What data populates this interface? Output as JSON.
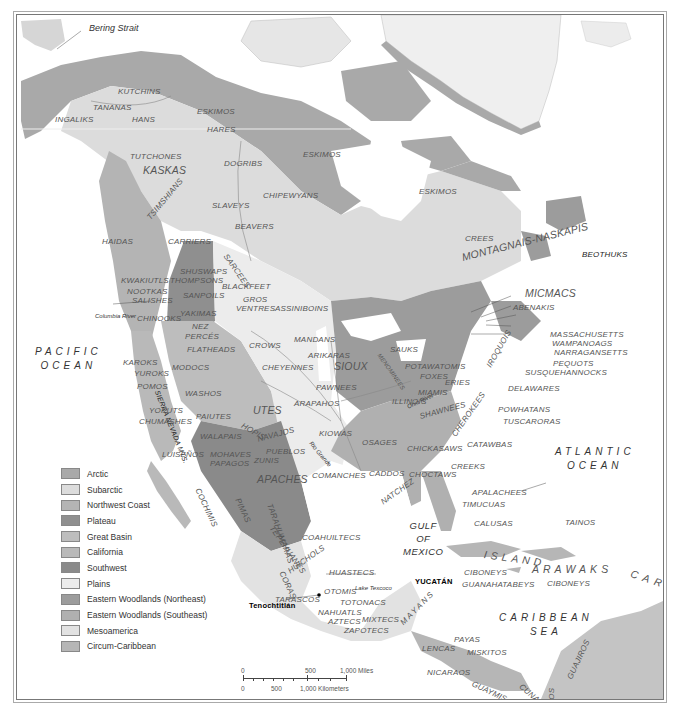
{
  "map": {
    "title_features": {
      "bering_strait": "Bering Strait",
      "columbia_river": "Columbia River",
      "sierra_nevada": "SIERRA NEVADA MTS.",
      "ohio_river": "Ohio River",
      "mississippi": "Mississippi",
      "lake_michigan": "Lake Michigan",
      "rio_grande": "Rio Grande",
      "missouri": "Missouri",
      "lake_texcoco": "Lake Texcoco",
      "tenochtitlan": "Tenochtitlán",
      "yucatan": "YUCATÁN"
    },
    "oceans": {
      "pacific": [
        "PACIFIC",
        "OCEAN"
      ],
      "atlantic": [
        "ATLANTIC",
        "OCEAN"
      ],
      "gulf": [
        "GULF",
        "OF",
        "MEXICO"
      ],
      "caribbean": [
        "CARIBBEAN",
        "SEA"
      ]
    },
    "peoples": {
      "kutchins": "KUTCHINS",
      "tananas": "TANANAS",
      "ingaliks": "INGALIKS",
      "hans": "HANS",
      "eskimos_nw": "ESKIMOS",
      "hares": "HARES",
      "eskimos_c": "ESKIMOS",
      "eskimos_e": "ESKIMOS",
      "tutchones": "TUTCHONES",
      "kaskas": "KASKAS",
      "dogribs": "DOGRIBS",
      "tsimshians": "TSIMSHIANS",
      "slaveys": "SLAVEYS",
      "chipewyans": "CHIPEWYANS",
      "beavers": "BEAVERS",
      "haidas": "HAIDAS",
      "carriers": "CARRIERS",
      "sarcees": "SARCEES",
      "crees": "CREES",
      "montagnais": "MONTAGNAIS-NASKAPIS",
      "beothuks": "BEOTHUKS",
      "kwakiutls": "KWAKIUTLS",
      "shuswaps": "SHUSWAPS",
      "thompsons": "THOMPSONS",
      "nootkas": "NOOTKAS",
      "salishes": "SALISHES",
      "sanpoils": "SANPOILS",
      "blackfeet": "BLACKFEET",
      "gros": "GROS",
      "ventres": "VENTRES",
      "assiniboins": "ASSINIBOINS",
      "chinooks": "CHINOOKS",
      "yakimas": "YAKIMAS",
      "nez": "NEZ",
      "perces": "PERCÉS",
      "flatheads": "FLATHEADS",
      "crows": "CROWS",
      "mandans": "MANDANS",
      "arikaras": "ARIKARAS",
      "sioux": "SIOUX",
      "karoks": "KAROKS",
      "yuroks": "YUROKS",
      "modocs": "MODOCS",
      "cheyennes": "CHEYENNES",
      "pomos": "POMOS",
      "washos": "WASHOS",
      "pawnees": "PAWNEES",
      "arapahos": "ARAPAHOS",
      "yokuts": "YOKUTS",
      "chumashes": "CHUMASHES",
      "paiutes": "PAIUTES",
      "utes": "UTES",
      "walapais": "WALAPAIS",
      "hopis": "HOPIS",
      "navajos": "NAVAJOS",
      "kiowas": "KIOWAS",
      "luisenos": "LUISEÑOS",
      "mohaves": "MOHAVES",
      "papagos": "PAPAGOS",
      "pueblos": "PUEBLOS",
      "zunis": "ZUNIS",
      "apaches": "APACHES",
      "comanches": "COMANCHES",
      "osages": "OSAGES",
      "caddos": "CADDOS",
      "cochimis": "COCHIMIS",
      "pimas": "PIMAS",
      "tarahumaras": "TARAHUMARAS",
      "tepehuanes": "TEPEHUANES",
      "coahuiltecs": "COAHUILTECS",
      "huichols": "HUICHOLS",
      "coras": "CORAS",
      "huastecs": "HUASTECS",
      "otomis": "OTOMIS",
      "tarascos": "TARASCOS",
      "totonacs": "TOTONACS",
      "nahuatls": "NAHUATLS",
      "aztecs": "AZTECS",
      "mixtecs": "MIXTECS",
      "zapotecs": "ZAPOTECS",
      "mayans": "MAYANS",
      "lencas": "LENCAS",
      "payas": "PAYAS",
      "miskitos": "MISKITOS",
      "nicaraos": "NICARAOS",
      "guaymis": "GUAYMIS",
      "cunas": "CUNAS",
      "chocos": "CHOCOS",
      "guajiros": "GUAJIROS",
      "tainos": "TAINOS",
      "island": "ISLAND",
      "arawaks": "ARAWAKS",
      "caribs": "CARIBS",
      "ciboneys_w": "CIBONEYS",
      "guanahatabeys": "GUANAHATABEYS",
      "ciboneys_e": "CIBONEYS",
      "micmacs": "MICMACS",
      "abenakis": "ABENAKIS",
      "massachusetts": "MASSACHUSETTS",
      "wampanoags": "WAMPANOAGS",
      "narragansetts": "NARRAGANSETTS",
      "pequots": "PEQUOTS",
      "susquehannocks": "SUSQUEHANNOCKS",
      "iroquois": "IROQUOIS",
      "sauks": "SAUKS",
      "menominees": "MENOMINEES",
      "potawatomis": "POTAWATOMIS",
      "foxes": "FOXES",
      "eries": "ERIES",
      "delawares": "DELAWARES",
      "miamis": "MIAMIS",
      "illinois": "ILLINOIS",
      "shawnees": "SHAWNEES",
      "cherokees": "CHEROKEES",
      "powhatans": "POWHATANS",
      "tuscaroras": "TUSCARORAS",
      "chickasaws": "CHICKASAWS",
      "catawbas": "CATAWBAS",
      "choctaws": "CHOCTAWS",
      "creeks": "CREEKS",
      "natchez": "NATCHEZ",
      "apalachees": "APALACHEES",
      "timucuas": "TIMUCUAS",
      "calusas": "CALUSAS"
    }
  },
  "legend": {
    "items": [
      {
        "label": "Arctic",
        "color": "#a9a9a9"
      },
      {
        "label": "Subarctic",
        "color": "#dcdcdc"
      },
      {
        "label": "Northwest Coast",
        "color": "#b4b4b4"
      },
      {
        "label": "Plateau",
        "color": "#8f8f8f"
      },
      {
        "label": "Great Basin",
        "color": "#bdbdbd"
      },
      {
        "label": "California",
        "color": "#b9b9b9"
      },
      {
        "label": "Southwest",
        "color": "#8a8a8a"
      },
      {
        "label": "Plains",
        "color": "#ececec"
      },
      {
        "label": "Eastern Woodlands (Northeast)",
        "color": "#9c9c9c"
      },
      {
        "label": "Eastern Woodlands (Southeast)",
        "color": "#b0b0b0"
      },
      {
        "label": "Mesoamerica",
        "color": "#e2e2e2"
      },
      {
        "label": "Circum-Caribbean",
        "color": "#b6b6b6"
      }
    ]
  },
  "scale": {
    "miles_0": "0",
    "miles_500": "500",
    "miles_1000": "1,000 Miles",
    "km_0": "0",
    "km_500": "500",
    "km_1000": "1,000 Kilometers"
  }
}
